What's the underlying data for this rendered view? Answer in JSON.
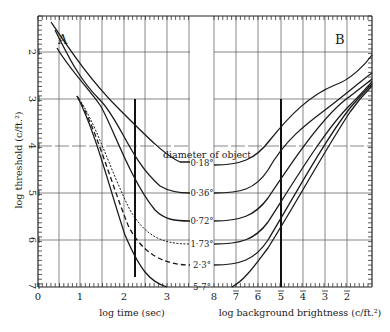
{
  "chart_data": {
    "type": "line",
    "title": "",
    "ylabel": "log threshold (c/ft.²)",
    "y_ticks": [
      "2̄",
      "3̄",
      "4̄",
      "5̄",
      "6̄",
      "7̄"
    ],
    "ylim": [
      -2,
      -7
    ],
    "legend_title": "diameter of object",
    "panels": [
      {
        "label": "A",
        "xlabel": "log time (sec)",
        "x_ticks": [
          "0",
          "1",
          "2",
          "3"
        ],
        "xlim": [
          0,
          3.5
        ],
        "marker_line_x": 2.25,
        "series": [
          {
            "name": "0·18°",
            "style": "solid",
            "x": [
              0.3,
              1.0,
              1.5,
              2.0,
              2.5,
              3.0,
              3.5
            ],
            "y": [
              -2.0,
              -2.75,
              -3.1,
              -3.55,
              -4.0,
              -4.35,
              -4.4
            ]
          },
          {
            "name": "0·36°",
            "style": "solid",
            "x": [
              0.45,
              1.0,
              1.5,
              2.0,
              2.5,
              3.0,
              3.5
            ],
            "y": [
              -2.2,
              -2.9,
              -3.35,
              -4.1,
              -4.7,
              -5.0,
              -5.0
            ]
          },
          {
            "name": "0·72°",
            "style": "solid",
            "x": [
              0.5,
              1.0,
              1.5,
              2.0,
              2.5,
              3.0,
              3.5
            ],
            "y": [
              -2.6,
              -3.0,
              -3.5,
              -4.5,
              -5.35,
              -5.65,
              -5.7
            ]
          },
          {
            "name": "1·73°",
            "style": "dashed-fine",
            "x": [
              0.9,
              1.5,
              2.0,
              2.5,
              3.0,
              3.5
            ],
            "y": [
              -3.0,
              -4.0,
              -5.0,
              -5.75,
              -6.05,
              -6.1
            ]
          },
          {
            "name": "2·3°",
            "style": "dashed",
            "x": [
              0.9,
              1.5,
              2.0,
              2.5,
              3.0,
              3.5
            ],
            "y": [
              -3.0,
              -4.1,
              -5.2,
              -6.1,
              -6.5,
              -6.55
            ]
          },
          {
            "name": "5·7°",
            "style": "solid",
            "x": [
              0.9,
              1.5,
              2.0,
              2.5,
              3.0
            ],
            "y": [
              -3.0,
              -4.2,
              -5.5,
              -6.6,
              -7.0
            ]
          }
        ]
      },
      {
        "label": "B",
        "xlabel": "log background brightness (c/ft.²)",
        "x_ticks": [
          "8",
          "7̄",
          "6̄",
          "5̄",
          "4̄",
          "3̄",
          "2̄"
        ],
        "xlim": [
          -8,
          -1.5
        ],
        "marker_line_x": -5,
        "series": [
          {
            "name": "0·18°",
            "x": [
              -8,
              -7,
              -6,
              -5,
              -4,
              -3,
              -1.6
            ],
            "y": [
              -4.4,
              -4.4,
              -4.2,
              -3.5,
              -3.0,
              -2.75,
              -2.1
            ]
          },
          {
            "name": "0·36°",
            "x": [
              -8,
              -7,
              -6,
              -5,
              -4,
              -3,
              -1.6
            ],
            "y": [
              -5.0,
              -5.0,
              -4.8,
              -4.2,
              -3.4,
              -3.0,
              -2.5
            ]
          },
          {
            "name": "0·72°",
            "x": [
              -8,
              -7,
              -6,
              -5,
              -4,
              -3,
              -1.6
            ],
            "y": [
              -5.7,
              -5.7,
              -5.5,
              -4.8,
              -3.9,
              -3.2,
              -2.6
            ]
          },
          {
            "name": "1·73°",
            "x": [
              -8,
              -7,
              -6,
              -5,
              -4,
              -3,
              -1.6
            ],
            "y": [
              -6.1,
              -6.1,
              -5.9,
              -5.3,
              -4.3,
              -3.4,
              -2.65
            ]
          },
          {
            "name": "2·3°",
            "x": [
              -8,
              -7,
              -6,
              -5,
              -4,
              -3,
              -1.6
            ],
            "y": [
              -6.55,
              -6.55,
              -6.3,
              -5.5,
              -4.5,
              -3.5,
              -2.7
            ]
          },
          {
            "name": "5·7°",
            "x": [
              -7.2,
              -6.5,
              -6,
              -5,
              -4,
              -3,
              -1.6
            ],
            "y": [
              -7.0,
              -6.6,
              -6.2,
              -5.6,
              -4.6,
              -3.6,
              -2.75
            ]
          }
        ]
      }
    ],
    "grid": true,
    "legend_position": "center, between panels"
  },
  "labels": {
    "panel_a": "A",
    "panel_b": "B",
    "ylabel": "log threshold (c/ft.²)",
    "xlabel_a": "log time (sec)",
    "xlabel_b": "log background brightness (c/ft.²)",
    "legend_title": "diameter of object",
    "diameters": [
      "0·18°",
      "0·36°",
      "0·72°",
      "1·73°",
      "2·3°",
      "5·7°"
    ],
    "y_ticks": [
      "2",
      "3",
      "4",
      "5",
      "6",
      "7"
    ],
    "x_ticks_a": [
      "0",
      "1",
      "2",
      "3"
    ],
    "x_ticks_b": [
      "8",
      "7",
      "6",
      "5",
      "4",
      "3",
      "2"
    ]
  }
}
